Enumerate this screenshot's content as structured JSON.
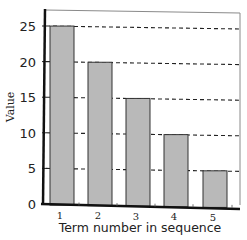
{
  "chart_data": {
    "type": "bar",
    "title": "",
    "xlabel": "Term number in sequence",
    "ylabel": "Value",
    "categories": [
      "1",
      "2",
      "3",
      "4",
      "5"
    ],
    "values": [
      25,
      20,
      15,
      10,
      5
    ],
    "ylim": [
      0,
      27
    ],
    "yticks": [
      0,
      5,
      10,
      15,
      20,
      25
    ],
    "grid": "horizontal dashed at 5, 10, 15, 20, 25",
    "legend": "none",
    "bar_color": "#b9b9b9",
    "bar_edge_color": "#333333"
  }
}
